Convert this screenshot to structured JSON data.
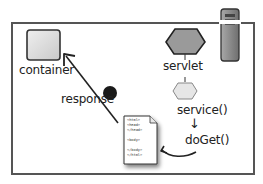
{
  "diagram": {
    "nodes": {
      "container": {
        "label": "container"
      },
      "servlet": {
        "label": "servlet"
      },
      "response": {
        "label": "response"
      },
      "server": {
        "label": ""
      }
    },
    "method_flow": {
      "first": "service()",
      "arrow": "↓",
      "second": "doGet()"
    },
    "html_document": {
      "lines": [
        "<html>",
        "<head>",
        "</head>",
        "",
        "<body>",
        "",
        "</body>",
        "</html>"
      ]
    },
    "colors": {
      "frame": "#555555",
      "container_fill": "#dcdcdc",
      "servlet_fill": "#9a9a9a",
      "thread_fill": "#e6e6e6",
      "server_fill": "#8c8c8c",
      "response_dot": "#1a1a1a"
    }
  }
}
